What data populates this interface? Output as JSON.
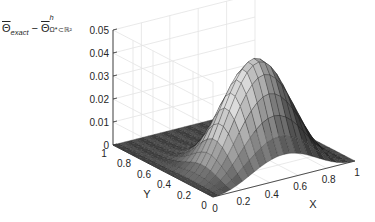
{
  "chart_data": {
    "type": "surface3d",
    "title": "",
    "zlabel": {
      "text": "Θ̄_exact − Θ̄^h_{Ω*⊂ℝ²}",
      "theta_left": "Θ",
      "sub_left": "exact",
      "minus": " − ",
      "theta_right": "Θ",
      "sup_right": "h",
      "sub_right": "Ω*⊂ℝ²"
    },
    "xlabel": "X",
    "ylabel": "Y",
    "xlim": [
      0,
      1
    ],
    "ylim": [
      0,
      1
    ],
    "zlim": [
      0,
      0.05
    ],
    "xticks": [
      "0",
      "0.2",
      "0.4",
      "0.6",
      "0.8",
      "1"
    ],
    "yticks": [
      "0",
      "0.2",
      "0.4",
      "0.6",
      "0.8",
      "1"
    ],
    "zticks": [
      "0",
      "0.01",
      "0.02",
      "0.03",
      "0.04",
      "0.05"
    ],
    "grid": true,
    "colormap": "gray",
    "surface_description": "Error surface near zero over most of the domain; a single hump centered at X≈0.5 near Y≈0–0.5, peak ≈0.045",
    "peak": {
      "x": 0.5,
      "y": 0.3,
      "z": 0.045
    },
    "front_edge_value_at_y0": {
      "x": 0.5,
      "z": 0.034
    }
  },
  "colors": {
    "axis": "#262626",
    "grid": "#e3e3e3",
    "background": "#ffffff"
  }
}
